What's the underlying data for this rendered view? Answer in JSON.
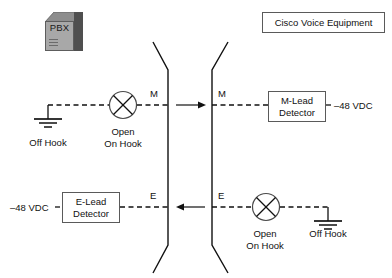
{
  "diagram": {
    "pbx": {
      "icon": "pbx-cube-icon",
      "label": "PBX"
    },
    "cisco_box": {
      "label": "Cisco Voice Equipment"
    },
    "demarcation": {
      "left_line": "break-line-left",
      "right_line": "break-line-right"
    },
    "m_circuit": {
      "lead_label_left": "M",
      "lead_label_right": "M",
      "arrow_direction": "right",
      "arrow_icon": "arrow-right-icon",
      "ground_icon": "ground-icon",
      "ground_label": "Off Hook",
      "switch_icon": "open-circuit-x-icon",
      "switch_label_line1": "Open",
      "switch_label_line2": "On Hook",
      "detector_line1": "M-Lead",
      "detector_line2": "Detector",
      "supply_label": "–48 VDC"
    },
    "e_circuit": {
      "lead_label_left": "E",
      "lead_label_right": "E",
      "arrow_direction": "left",
      "arrow_icon": "arrow-left-icon",
      "ground_icon": "ground-icon",
      "ground_label": "Off Hook",
      "switch_icon": "open-circuit-x-icon",
      "switch_label_line1": "Open",
      "switch_label_line2": "On Hook",
      "detector_line1": "E-Lead",
      "detector_line2": "Detector",
      "supply_label": "–48 VDC"
    },
    "colors": {
      "line": "#111111",
      "box_border": "#5a5a5a",
      "background": "#ffffff",
      "pbx_front": "#a8a8a8",
      "pbx_side": "#4f4f4f",
      "pbx_top": "#8d8d8d"
    }
  }
}
